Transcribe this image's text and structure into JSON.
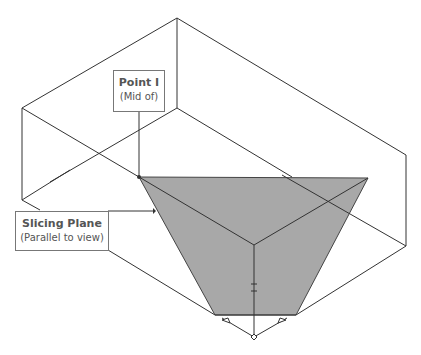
{
  "diagram": {
    "type": "isometric-box-slice",
    "callouts": [
      {
        "id": "point-i",
        "title": "Point I",
        "subtitle": "(Mid of)"
      },
      {
        "id": "slicing-plane",
        "title": "Slicing Plane",
        "subtitle": "(Parallel to view)"
      }
    ],
    "colors": {
      "line": "#333333",
      "plane_fill": "#a8a8a8",
      "callout_border": "#777777",
      "callout_text": "#555555"
    }
  }
}
